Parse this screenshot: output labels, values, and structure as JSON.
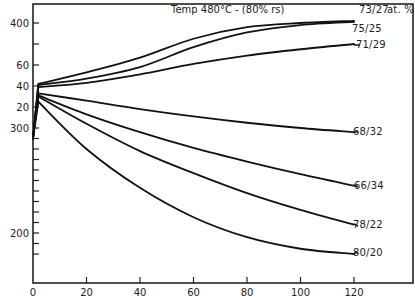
{
  "chart_data": {
    "type": "line",
    "title": "Temp 480°C - (80% rs)",
    "unit_note": "at. %",
    "xlabel": "",
    "ylabel": "",
    "xlim": [
      0,
      140
    ],
    "ylim": [
      152,
      419
    ],
    "x_ticks": [
      0,
      20,
      40,
      60,
      80,
      100,
      120
    ],
    "x_tick_labels": [
      "0",
      "20",
      "40",
      "60",
      "80",
      "100",
      "120"
    ],
    "y_ticks": [
      180,
      190,
      200,
      210,
      220,
      230,
      240,
      250,
      260,
      270,
      280,
      290,
      300,
      320,
      340,
      360,
      380,
      400
    ],
    "y_tick_labels": [
      {
        "value": 400,
        "label": "400"
      },
      {
        "value": 360,
        "label": "60"
      },
      {
        "value": 340,
        "label": "40"
      },
      {
        "value": 320,
        "label": "20"
      },
      {
        "value": 300,
        "label": "300"
      },
      {
        "value": 200,
        "label": "200"
      }
    ],
    "grid": false,
    "legend_position": "inline-right",
    "series": [
      {
        "name": "73/27",
        "x": [
          0,
          2,
          20,
          40,
          60,
          80,
          100,
          120
        ],
        "values": [
          290,
          342,
          353,
          367,
          385,
          396,
          400,
          402
        ]
      },
      {
        "name": "75/25",
        "x": [
          0,
          2,
          20,
          40,
          60,
          80,
          100,
          120
        ],
        "values": [
          290,
          341,
          347,
          358,
          377,
          391,
          398,
          401
        ]
      },
      {
        "name": "71/29",
        "x": [
          0,
          2,
          20,
          40,
          60,
          80,
          100,
          120
        ],
        "values": [
          290,
          339,
          343,
          351,
          361,
          369,
          375,
          380
        ]
      },
      {
        "name": "68/32",
        "x": [
          0,
          2,
          20,
          40,
          60,
          80,
          100,
          120
        ],
        "values": [
          290,
          333,
          326,
          318,
          311,
          305,
          300,
          296
        ]
      },
      {
        "name": "66/34",
        "x": [
          0,
          2,
          20,
          40,
          60,
          80,
          100,
          120
        ],
        "values": [
          290,
          331,
          313,
          296,
          281,
          268,
          256,
          245
        ]
      },
      {
        "name": "78/22",
        "x": [
          0,
          2,
          20,
          40,
          60,
          80,
          100,
          120
        ],
        "values": [
          290,
          330,
          304,
          278,
          257,
          238,
          222,
          208
        ]
      },
      {
        "name": "80/20",
        "x": [
          0,
          2,
          20,
          40,
          60,
          80,
          100,
          120
        ],
        "values": [
          290,
          325,
          280,
          243,
          215,
          196,
          185,
          180
        ]
      }
    ]
  },
  "labels": {
    "title": "Temp 480°C -  (80% rs)",
    "unit": "at. %",
    "series_labels": [
      "73/27",
      "75/25",
      "71/29",
      "68/32",
      "66/34",
      "78/22",
      "80/20"
    ]
  }
}
